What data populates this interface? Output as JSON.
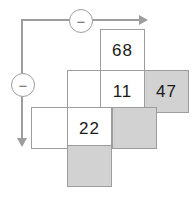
{
  "diagram": {
    "colors": {
      "shaded_cell": "#d2d2d2",
      "white_cell": "#ffffff",
      "grid_line": "#9d9d9d",
      "connector": "#9d9d9d",
      "text": "#1a1a1a"
    },
    "operators": [
      {
        "name": "top-minus-operator",
        "symbol": "−"
      },
      {
        "name": "left-minus-operator",
        "symbol": "−"
      }
    ],
    "arrows": [
      {
        "name": "horizontal-arrow",
        "direction": "right"
      },
      {
        "name": "vertical-arrow",
        "direction": "down"
      }
    ],
    "cells": {
      "top_number": "68",
      "middle_left_empty": "",
      "middle_number": "11",
      "middle_right_number": "47",
      "bottom_left_empty": "",
      "bottom_number": "22",
      "shaded_middle_empty": "",
      "shaded_bottom_empty": ""
    }
  }
}
